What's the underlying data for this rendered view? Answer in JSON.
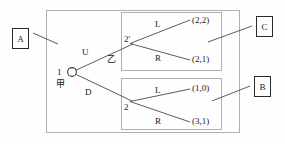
{
  "figure": {
    "type": "extensive-form-game-tree",
    "root": {
      "player_label": "1",
      "player_name_cjk": "甲",
      "node_marker": "circle"
    },
    "second_player_label_cjk": "乙",
    "actions": {
      "up": "U",
      "down": "D",
      "left": "L",
      "right": "R"
    },
    "nodes": [
      {
        "id": "n1",
        "label": "1",
        "sublabel": "甲",
        "x": 72,
        "y": 72,
        "marker": "circle"
      },
      {
        "id": "n2prime",
        "label": "2'",
        "x": 133,
        "y": 42,
        "marker": "point"
      },
      {
        "id": "n2",
        "label": "2",
        "x": 132,
        "y": 102,
        "marker": "point"
      }
    ],
    "branches": [
      {
        "from": "n1",
        "to": "n2prime",
        "label": "U"
      },
      {
        "from": "n1",
        "to": "n2",
        "label": "D"
      },
      {
        "from": "n2prime",
        "to": "t1",
        "label": "L"
      },
      {
        "from": "n2prime",
        "to": "t2",
        "label": "R"
      },
      {
        "from": "n2",
        "to": "t3",
        "label": "L"
      },
      {
        "from": "n2",
        "to": "t4",
        "label": "R"
      }
    ],
    "terminals": [
      {
        "id": "t1",
        "payoff": "(2,2)"
      },
      {
        "id": "t2",
        "payoff": "(2,1)"
      },
      {
        "id": "t3",
        "payoff": "(1,0)"
      },
      {
        "id": "t4",
        "payoff": "(3,1)"
      }
    ],
    "callouts": [
      {
        "id": "A",
        "label": "A",
        "x": 12,
        "y": 28,
        "w": 17,
        "h": 21
      },
      {
        "id": "C",
        "label": "C",
        "x": 256,
        "y": 16,
        "w": 17,
        "h": 21
      },
      {
        "id": "B",
        "label": "B",
        "x": 254,
        "y": 76,
        "w": 17,
        "h": 21
      }
    ],
    "boxes": [
      {
        "id": "outer",
        "name": "A",
        "x": 46,
        "y": 10,
        "w": 194,
        "h": 123
      },
      {
        "id": "upper-information-set",
        "name": "C",
        "x": 121,
        "y": 12,
        "w": 101,
        "h": 59
      },
      {
        "id": "lower-information-set",
        "name": "B",
        "x": 121,
        "y": 78,
        "w": 101,
        "h": 52
      }
    ],
    "colors": {
      "line": "#555555",
      "box_border": "#aaaaaa",
      "tag_border": "#2a2a2a",
      "text": "#1a1a1a",
      "background": "#fefefe"
    }
  }
}
